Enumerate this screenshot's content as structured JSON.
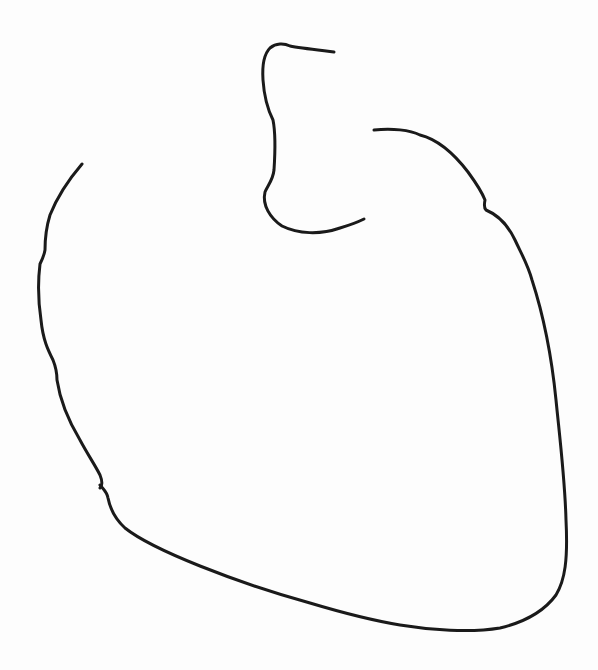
{
  "drawing": {
    "subject": "heart-outline-sketch",
    "background_color": "#fdfdfd",
    "stroke_color": "#1a1a1a",
    "stroke_width": 3
  }
}
